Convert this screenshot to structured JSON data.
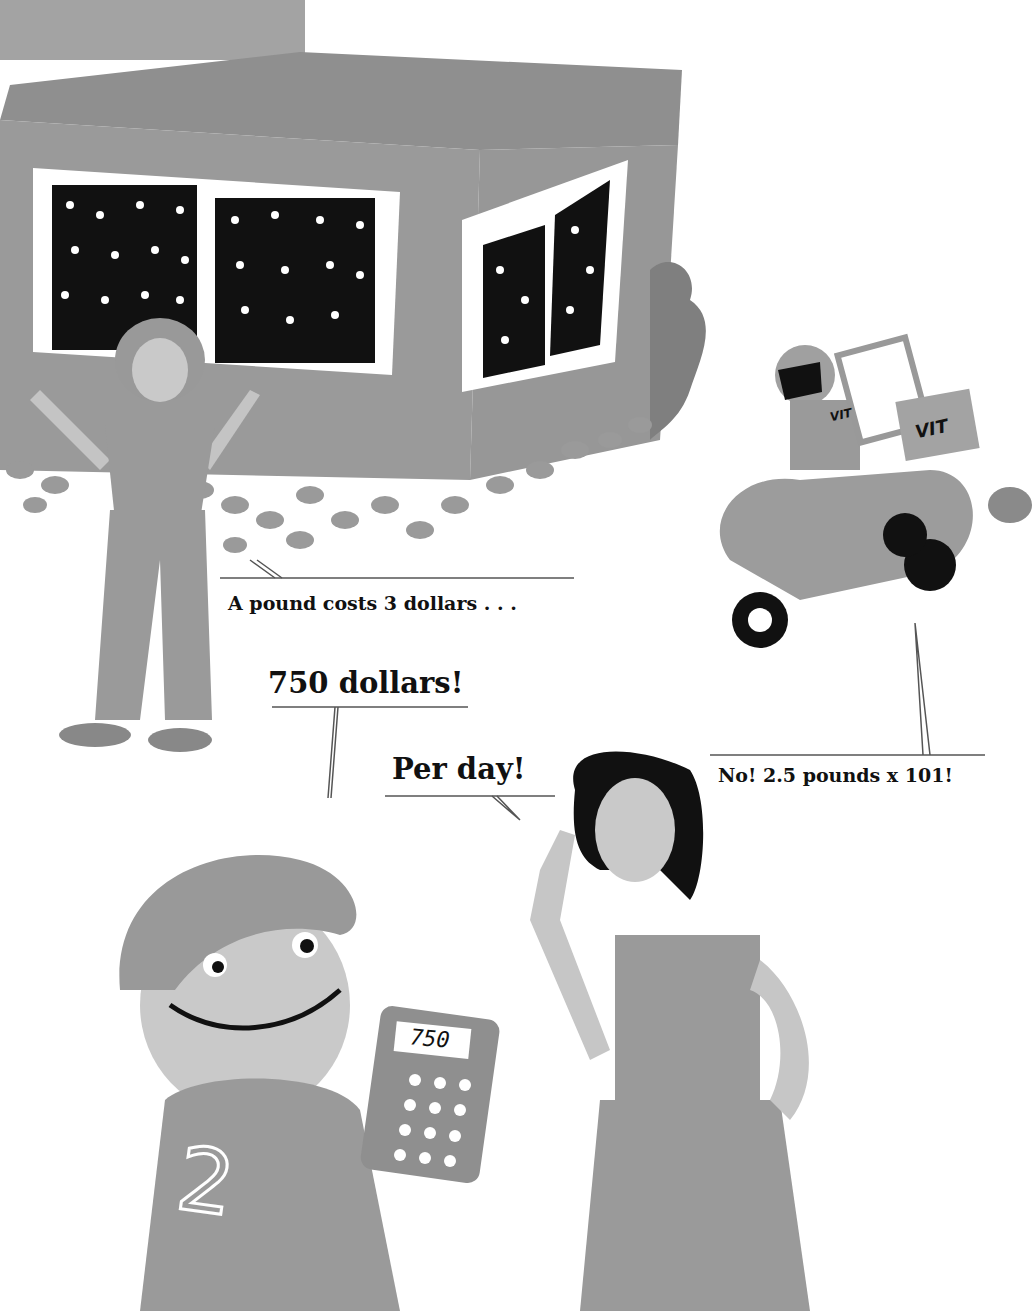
{
  "scene": {
    "description": "Grayscale children's book illustration: a woman in front of a house with patterned windows, a delivery rider on a scooter, a boy holding a calculator, and a girl raising a finger.",
    "colors": {
      "background": "#ffffff",
      "house_wall": "#9a9a9a",
      "house_roof": "#8e8e8e",
      "window_frame": "#ffffff",
      "pattern_dark": "#111111",
      "skin_light": "#c9c9c9",
      "clothing_mid": "#9d9d9d",
      "hair_dark": "#111111",
      "caption_text": "#111111",
      "caption_rule": "#555555"
    }
  },
  "captions": {
    "woman": "A pound costs 3 dollars . . .",
    "boy": "750 dollars!",
    "girl": "Per day!",
    "rider": "No! 2.5 pounds x 101!"
  },
  "calculator": {
    "display": "750"
  },
  "scooter": {
    "logo_text": "VIT"
  },
  "boy_shirt": {
    "number": "2"
  }
}
